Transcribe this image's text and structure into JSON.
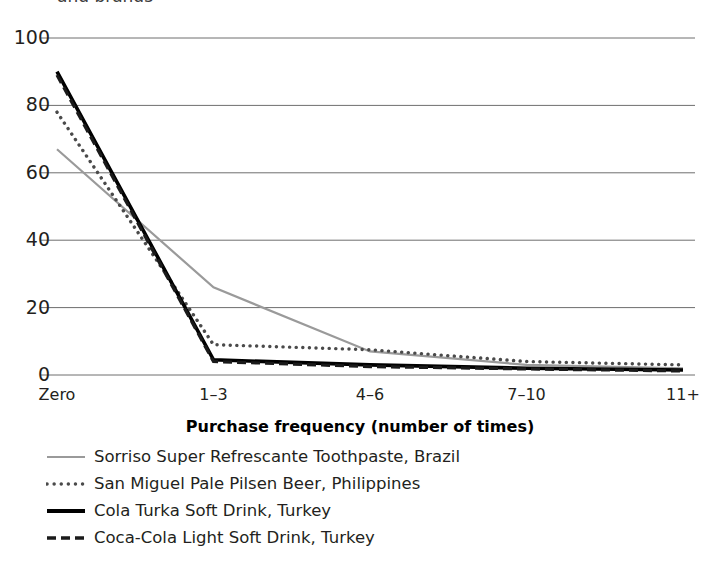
{
  "chart_data": {
    "type": "line",
    "title": "and brands",
    "title_clipped": true,
    "xlabel": "Purchase frequency (number of times)",
    "ylabel": "",
    "categories": [
      "Zero",
      "1–3",
      "4–6",
      "7–10",
      "11+"
    ],
    "ylim": [
      0,
      100
    ],
    "yticks": [
      0,
      20,
      40,
      60,
      80,
      100
    ],
    "grid": "horizontal",
    "legend_position": "below",
    "series": [
      {
        "name": "Sorriso Super Refrescante Toothpaste, Brazil",
        "values": [
          67,
          26,
          7,
          3,
          2
        ],
        "style": "solid-thin",
        "color": "#9a9a9a"
      },
      {
        "name": "San Miguel Pale Pilsen Beer, Philippines",
        "values": [
          78,
          9,
          7.5,
          4,
          3
        ],
        "style": "dotted",
        "color": "#4a4a4a"
      },
      {
        "name": "Cola Turka Soft Drink, Turkey",
        "values": [
          90,
          4.5,
          3,
          2,
          1.5
        ],
        "style": "solid-thick",
        "color": "#000000"
      },
      {
        "name": "Coca-Cola Light Soft Drink, Turkey",
        "values": [
          89,
          4,
          2.5,
          1.8,
          1.2
        ],
        "style": "dashed",
        "color": "#1a1a1a"
      }
    ]
  },
  "axis": {
    "y_ticks": [
      "0",
      "20",
      "40",
      "60",
      "80",
      "100"
    ],
    "x_ticks": [
      "Zero",
      "1–3",
      "4–6",
      "7–10",
      "11+"
    ],
    "x_title": "Purchase frequency (number of times)"
  },
  "legend": {
    "items": [
      {
        "label": "Sorriso Super Refrescante Toothpaste, Brazil",
        "marker": "line-solid-thin-gray"
      },
      {
        "label": "San Miguel Pale Pilsen Beer, Philippines",
        "marker": "line-dotted-gray"
      },
      {
        "label": "Cola Turka Soft Drink, Turkey",
        "marker": "line-solid-thick-black"
      },
      {
        "label": "Coca-Cola Light Soft Drink, Turkey",
        "marker": "line-dashed-black"
      }
    ]
  },
  "title": {
    "text": "and brands"
  }
}
